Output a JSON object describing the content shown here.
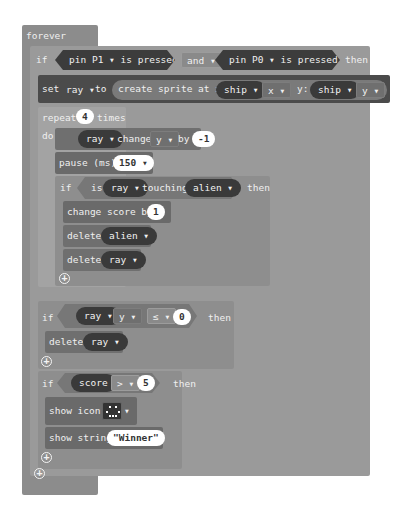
{
  "forever": {
    "label": "forever"
  },
  "if1": {
    "keyword": "if",
    "left_condition": {
      "pin_label": "pin",
      "pin_value": "P1",
      "suffix": "is pressed"
    },
    "operator": "and",
    "right_condition": {
      "pin_label": "pin",
      "pin_value": "P0",
      "suffix": "is pressed"
    },
    "then": "then"
  },
  "set_block": {
    "set": "set",
    "variable": "ray",
    "to": "to",
    "create": "create sprite at x:",
    "x_sprite": "ship",
    "x_prop": "x",
    "y_label": "y:",
    "y_sprite": "ship",
    "y_prop": "y"
  },
  "repeat": {
    "label": "repeat",
    "count": "4",
    "times": "times",
    "do": "do"
  },
  "change_block": {
    "sprite": "ray",
    "change": "change",
    "prop": "y",
    "by": "by",
    "value": "-1"
  },
  "pause_block": {
    "label": "pause (ms)",
    "value": "150"
  },
  "if2": {
    "keyword": "if",
    "is": "is",
    "sprite": "ray",
    "touching": "touching",
    "target": "alien",
    "then": "then"
  },
  "change_score": {
    "label": "change score by",
    "value": "1"
  },
  "delete_alien": {
    "label": "delete",
    "target": "alien"
  },
  "delete_ray": {
    "label": "delete",
    "target": "ray"
  },
  "if3": {
    "keyword": "if",
    "sprite": "ray",
    "prop": "y",
    "operator": "≤",
    "value": "0",
    "then": "then"
  },
  "delete_ray2": {
    "label": "delete",
    "target": "ray"
  },
  "if4": {
    "keyword": "if",
    "variable": "score",
    "operator": ">",
    "value": "5",
    "then": "then"
  },
  "show_icon": {
    "label": "show icon"
  },
  "show_string": {
    "label": "show string",
    "value": "\"Winner\""
  },
  "icons": {
    "dropdown": "▾",
    "add": "+"
  }
}
